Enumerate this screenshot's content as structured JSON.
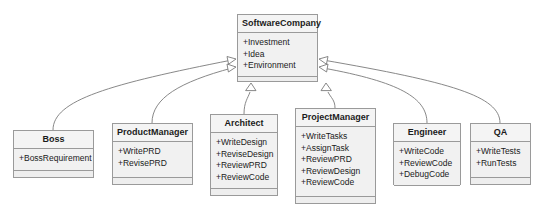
{
  "diagram": {
    "type": "uml-class-diagram",
    "relationship": "generalization",
    "colors": {
      "box_fill": "#f1f1f1",
      "header_fill": "#f4f4f4",
      "border": "#9a9a9a",
      "text": "#1b1b1b",
      "edge": "#7a7a7a",
      "background": "#ffffff"
    }
  },
  "classes": [
    {
      "id": "softwarecompany",
      "name": "SoftwareCompany",
      "members": [
        "+Investment",
        "+Idea",
        "+Environment"
      ],
      "x": 237,
      "y": 14,
      "w": 81,
      "h": 68
    },
    {
      "id": "boss",
      "name": "Boss",
      "members": [
        "+BossRequirement"
      ],
      "x": 13,
      "y": 130,
      "w": 81,
      "h": 48
    },
    {
      "id": "productmanager",
      "name": "ProductManager",
      "members": [
        "+WritePRD",
        "+RevisePRD"
      ],
      "x": 112,
      "y": 123,
      "w": 81,
      "h": 62
    },
    {
      "id": "architect",
      "name": "Architect",
      "members": [
        "+WriteDesign",
        "+ReviseDesign",
        "+ReviewPRD",
        "+ReviewCode"
      ],
      "x": 210,
      "y": 114,
      "w": 68,
      "h": 82
    },
    {
      "id": "projectmanager",
      "name": "ProjectManager",
      "members": [
        "+WriteTasks",
        "+AssignTask",
        "+ReviewPRD",
        "+ReviewDesign",
        "+ReviewCode"
      ],
      "x": 295,
      "y": 108,
      "w": 81,
      "h": 96
    },
    {
      "id": "engineer",
      "name": "Engineer",
      "members": [
        "+WriteCode",
        "+ReviewCode",
        "+DebugCode"
      ],
      "x": 393,
      "y": 123,
      "w": 68,
      "h": 62
    },
    {
      "id": "qa",
      "name": "QA",
      "members": [
        "+WriteTests",
        "+RunTests"
      ],
      "x": 470,
      "y": 123,
      "w": 61,
      "h": 62
    }
  ],
  "edges": [
    {
      "from": "boss",
      "to": "softwarecompany",
      "arrow": "hollow-triangle"
    },
    {
      "from": "productmanager",
      "to": "softwarecompany",
      "arrow": "hollow-triangle"
    },
    {
      "from": "architect",
      "to": "softwarecompany",
      "arrow": "hollow-triangle"
    },
    {
      "from": "projectmanager",
      "to": "softwarecompany",
      "arrow": "hollow-triangle"
    },
    {
      "from": "engineer",
      "to": "softwarecompany",
      "arrow": "hollow-triangle"
    },
    {
      "from": "qa",
      "to": "softwarecompany",
      "arrow": "hollow-triangle"
    }
  ]
}
